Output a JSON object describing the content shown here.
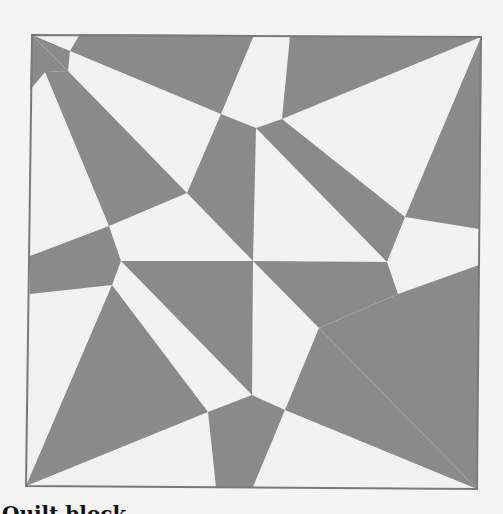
{
  "figure": {
    "colors": {
      "background": "#f4f4f2",
      "light": "#f2f2f0",
      "dark": "#8a8a8a",
      "border": "#7a7a7a"
    },
    "frame": {
      "top_left": [
        32,
        35
      ],
      "top_right": [
        481,
        37
      ],
      "bottom_right": [
        477,
        489
      ],
      "bottom_left": [
        26,
        486
      ]
    },
    "dark_polygons": [
      {
        "name": "top-left-corner-sliver",
        "points": "32,35 68,71 45,72 30,90"
      },
      {
        "name": "top-left-kite",
        "points": "32,35 70,51 68,71"
      },
      {
        "name": "top-band-left",
        "points": "80,34 254,35 221,114 70,51"
      },
      {
        "name": "top-band-right",
        "points": "290,36 481,37 282,119"
      },
      {
        "name": "left-spike",
        "points": "45,72 68,71 187,193 109,226"
      },
      {
        "name": "center-upper-left",
        "points": "221,114 256,128 253,261 187,193"
      },
      {
        "name": "center-upper-right",
        "points": "256,128 282,119 405,217 387,262"
      },
      {
        "name": "right-spike",
        "points": "481,37 479,229 405,217"
      },
      {
        "name": "left-band",
        "points": "30,256 109,226 121,261 112,285 30,294"
      },
      {
        "name": "center-lower-left",
        "points": "121,261 253,261 252,395"
      },
      {
        "name": "center-lower-right",
        "points": "253,261 387,262 398,294 319,328"
      },
      {
        "name": "right-band",
        "points": "398,294 479,265 477,489 319,328"
      },
      {
        "name": "bottom-left-spike",
        "points": "112,285 208,412 26,486"
      },
      {
        "name": "bottom-center",
        "points": "208,412 252,395 285,410 253,487 216,487"
      },
      {
        "name": "bottom-right-spike",
        "points": "319,328 477,489 285,410"
      }
    ]
  },
  "caption": {
    "visible_fragment": "Quilt block"
  }
}
